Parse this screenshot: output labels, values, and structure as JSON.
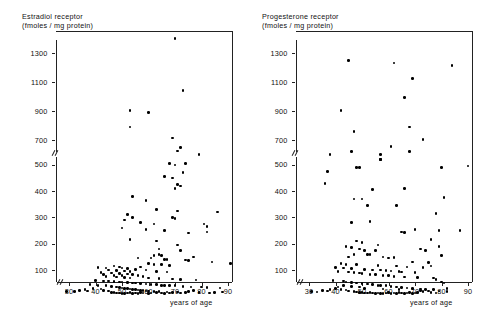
{
  "figure": {
    "width": 481,
    "height": 316,
    "background": "#ffffff",
    "point_color": "#000000",
    "axis_color": "#222222"
  },
  "panels": [
    {
      "id": "estradiol",
      "title_line1": "Estradiol receptor",
      "title_line2": "(fmoles / mg protein)"
    },
    {
      "id": "progesterone",
      "title_line1": "Progesterone receptor",
      "title_line2": "(fmoles / mg  protein)"
    }
  ],
  "axes": {
    "xlabel": "years of age",
    "xticks": [
      30,
      40,
      50,
      60,
      70,
      80,
      90
    ],
    "yticks_lower": [
      100,
      200,
      300,
      400,
      500
    ],
    "yticks_upper": [
      700,
      900,
      1100,
      1300
    ],
    "ylabel": "",
    "xlim": [
      24,
      94
    ],
    "ylim_lower": [
      0,
      560
    ],
    "ylim_upper": [
      640,
      1420
    ],
    "axis_break": true,
    "grid": false
  },
  "chart_data": [
    {
      "type": "scatter",
      "title": "Estradiol receptor (fmoles / mg protein)",
      "xlabel": "years of age",
      "ylabel": "Estradiol receptor (fmoles / mg protein)",
      "xlim": [
        24,
        94
      ],
      "ylim": [
        0,
        1420
      ],
      "grid": false,
      "legend": "none",
      "points": [
        [
          70,
          1400
        ],
        [
          73,
          1040
        ],
        [
          53,
          905
        ],
        [
          60,
          890
        ],
        [
          53,
          790
        ],
        [
          69,
          715
        ],
        [
          72,
          650
        ],
        [
          71,
          625
        ],
        [
          79,
          600
        ],
        [
          68,
          505
        ],
        [
          70,
          500
        ],
        [
          74,
          505
        ],
        [
          73,
          470
        ],
        [
          66,
          455
        ],
        [
          69,
          450
        ],
        [
          71,
          425
        ],
        [
          72,
          420
        ],
        [
          70,
          410
        ],
        [
          54,
          380
        ],
        [
          59,
          365
        ],
        [
          63,
          330
        ],
        [
          71,
          325
        ],
        [
          86,
          320
        ],
        [
          52,
          310
        ],
        [
          54,
          300
        ],
        [
          69,
          300
        ],
        [
          70,
          295
        ],
        [
          51,
          290
        ],
        [
          57,
          280
        ],
        [
          62,
          275
        ],
        [
          81,
          275
        ],
        [
          82,
          265
        ],
        [
          50,
          260
        ],
        [
          59,
          255
        ],
        [
          66,
          250
        ],
        [
          82,
          245
        ],
        [
          75,
          240
        ],
        [
          53,
          215
        ],
        [
          63,
          210
        ],
        [
          71,
          195
        ],
        [
          64,
          180
        ],
        [
          72,
          175
        ],
        [
          64,
          160
        ],
        [
          62,
          155
        ],
        [
          65,
          155
        ],
        [
          77,
          150
        ],
        [
          56,
          145
        ],
        [
          61,
          145
        ],
        [
          66,
          140
        ],
        [
          67,
          140
        ],
        [
          74,
          138
        ],
        [
          75,
          135
        ],
        [
          84,
          130
        ],
        [
          91,
          125
        ],
        [
          60,
          125
        ],
        [
          62,
          122
        ],
        [
          65,
          120
        ],
        [
          68,
          118
        ],
        [
          47,
          115
        ],
        [
          49,
          112
        ],
        [
          57,
          112
        ],
        [
          41,
          110
        ],
        [
          44,
          108
        ],
        [
          50,
          108
        ],
        [
          52,
          105
        ],
        [
          55,
          102
        ],
        [
          59,
          100
        ],
        [
          45,
          100
        ],
        [
          48,
          98
        ],
        [
          51,
          96
        ],
        [
          53,
          95
        ],
        [
          63,
          95
        ],
        [
          67,
          92
        ],
        [
          42,
          90
        ],
        [
          46,
          88
        ],
        [
          49,
          86
        ],
        [
          52,
          85
        ],
        [
          54,
          84
        ],
        [
          43,
          82
        ],
        [
          47,
          80
        ],
        [
          50,
          78
        ],
        [
          56,
          78
        ],
        [
          58,
          76
        ],
        [
          44,
          75
        ],
        [
          48,
          74
        ],
        [
          51,
          72
        ],
        [
          53,
          70
        ],
        [
          60,
          70
        ],
        [
          64,
          68
        ],
        [
          69,
          66
        ],
        [
          72,
          65
        ],
        [
          78,
          62
        ],
        [
          40,
          60
        ],
        [
          43,
          58
        ],
        [
          45,
          58
        ],
        [
          47,
          56
        ],
        [
          49,
          55
        ],
        [
          50,
          54
        ],
        [
          52,
          52
        ],
        [
          54,
          50
        ],
        [
          55,
          50
        ],
        [
          57,
          48
        ],
        [
          59,
          46
        ],
        [
          61,
          45
        ],
        [
          63,
          44
        ],
        [
          65,
          42
        ],
        [
          66,
          42
        ],
        [
          68,
          40
        ],
        [
          70,
          40
        ],
        [
          73,
          38
        ],
        [
          76,
          36
        ],
        [
          80,
          35
        ],
        [
          82,
          34
        ],
        [
          87,
          32
        ],
        [
          38,
          45
        ],
        [
          41,
          42
        ],
        [
          44,
          40
        ],
        [
          46,
          38
        ],
        [
          48,
          36
        ],
        [
          49,
          34
        ],
        [
          50,
          32
        ],
        [
          51,
          30
        ],
        [
          52,
          30
        ],
        [
          53,
          28
        ],
        [
          54,
          26
        ],
        [
          55,
          25
        ],
        [
          56,
          24
        ],
        [
          57,
          22
        ],
        [
          58,
          22
        ],
        [
          59,
          20
        ],
        [
          60,
          20
        ],
        [
          62,
          18
        ],
        [
          64,
          18
        ],
        [
          67,
          16
        ],
        [
          71,
          16
        ],
        [
          74,
          15
        ],
        [
          29,
          18
        ],
        [
          32,
          18
        ],
        [
          34,
          22
        ],
        [
          36,
          26
        ],
        [
          37,
          20
        ],
        [
          39,
          30
        ],
        [
          42,
          28
        ],
        [
          43,
          22
        ],
        [
          45,
          20
        ],
        [
          46,
          15
        ],
        [
          47,
          14
        ],
        [
          48,
          12
        ],
        [
          49,
          12
        ],
        [
          50,
          10
        ],
        [
          51,
          10
        ],
        [
          52,
          12
        ],
        [
          53,
          14
        ],
        [
          54,
          10
        ],
        [
          55,
          12
        ],
        [
          56,
          10
        ],
        [
          57,
          14
        ],
        [
          58,
          12
        ],
        [
          60,
          10
        ],
        [
          61,
          12
        ],
        [
          63,
          14
        ],
        [
          65,
          12
        ],
        [
          66,
          10
        ],
        [
          68,
          12
        ],
        [
          69,
          14
        ],
        [
          72,
          12
        ],
        [
          75,
          18
        ],
        [
          77,
          22
        ],
        [
          79,
          14
        ],
        [
          83,
          12
        ],
        [
          85,
          14
        ],
        [
          88,
          16
        ]
      ]
    },
    {
      "type": "scatter",
      "title": "Progesterone receptor (fmoles / mg protein)",
      "xlabel": "years of age",
      "ylabel": "Progesterone receptor (fmoles / mg protein)",
      "xlim": [
        24,
        94
      ],
      "ylim": [
        0,
        1420
      ],
      "grid": false,
      "legend": "none",
      "points": [
        [
          45,
          1250
        ],
        [
          62,
          1230
        ],
        [
          84,
          1215
        ],
        [
          69,
          1125
        ],
        [
          66,
          995
        ],
        [
          42,
          905
        ],
        [
          68,
          790
        ],
        [
          47,
          760
        ],
        [
          73,
          705
        ],
        [
          61,
          655
        ],
        [
          46,
          620
        ],
        [
          68,
          620
        ],
        [
          38,
          600
        ],
        [
          57,
          540
        ],
        [
          57,
          520
        ],
        [
          49,
          490
        ],
        [
          48,
          490
        ],
        [
          90,
          495
        ],
        [
          80,
          490
        ],
        [
          37,
          475
        ],
        [
          57,
          520
        ],
        [
          36,
          430
        ],
        [
          47,
          370
        ],
        [
          50,
          370
        ],
        [
          54,
          405
        ],
        [
          52,
          345
        ],
        [
          66,
          410
        ],
        [
          53,
          285
        ],
        [
          46,
          280
        ],
        [
          63,
          345
        ],
        [
          81,
          375
        ],
        [
          78,
          315
        ],
        [
          79,
          250
        ],
        [
          65,
          245
        ],
        [
          66,
          243
        ],
        [
          70,
          255
        ],
        [
          87,
          250
        ],
        [
          76,
          215
        ],
        [
          48,
          210
        ],
        [
          50,
          205
        ],
        [
          56,
          195
        ],
        [
          44,
          190
        ],
        [
          46,
          185
        ],
        [
          49,
          180
        ],
        [
          51,
          175
        ],
        [
          55,
          175
        ],
        [
          72,
          180
        ],
        [
          74,
          175
        ],
        [
          79,
          190
        ],
        [
          80,
          155
        ],
        [
          47,
          160
        ],
        [
          52,
          160
        ],
        [
          53,
          158
        ],
        [
          45,
          150
        ],
        [
          58,
          150
        ],
        [
          60,
          145
        ],
        [
          62,
          148
        ],
        [
          69,
          130
        ],
        [
          75,
          128
        ],
        [
          42,
          125
        ],
        [
          44,
          120
        ],
        [
          48,
          120
        ],
        [
          56,
          118
        ],
        [
          63,
          115
        ],
        [
          67,
          112
        ],
        [
          73,
          110
        ],
        [
          76,
          115
        ],
        [
          40,
          110
        ],
        [
          43,
          108
        ],
        [
          46,
          105
        ],
        [
          51,
          102
        ],
        [
          54,
          100
        ],
        [
          57,
          100
        ],
        [
          59,
          98
        ],
        [
          61,
          96
        ],
        [
          64,
          95
        ],
        [
          65,
          92
        ],
        [
          70,
          90
        ],
        [
          41,
          95
        ],
        [
          45,
          92
        ],
        [
          47,
          90
        ],
        [
          49,
          88
        ],
        [
          50,
          86
        ],
        [
          53,
          84
        ],
        [
          55,
          82
        ],
        [
          58,
          80
        ],
        [
          60,
          78
        ],
        [
          62,
          76
        ],
        [
          66,
          74
        ],
        [
          71,
          72
        ],
        [
          77,
          70
        ],
        [
          78,
          65
        ],
        [
          39,
          60
        ],
        [
          43,
          58
        ],
        [
          44,
          55
        ],
        [
          46,
          52
        ],
        [
          48,
          50
        ],
        [
          50,
          48
        ],
        [
          52,
          46
        ],
        [
          54,
          44
        ],
        [
          56,
          42
        ],
        [
          57,
          42
        ],
        [
          59,
          40
        ],
        [
          61,
          38
        ],
        [
          63,
          36
        ],
        [
          65,
          34
        ],
        [
          67,
          32
        ],
        [
          69,
          30
        ],
        [
          72,
          28
        ],
        [
          74,
          26
        ],
        [
          80,
          55
        ],
        [
          81,
          50
        ],
        [
          82,
          30
        ],
        [
          35,
          22
        ],
        [
          37,
          20
        ],
        [
          40,
          30
        ],
        [
          42,
          26
        ],
        [
          44,
          24
        ],
        [
          45,
          20
        ],
        [
          47,
          18
        ],
        [
          48,
          16
        ],
        [
          49,
          14
        ],
        [
          50,
          14
        ],
        [
          51,
          12
        ],
        [
          52,
          12
        ],
        [
          53,
          14
        ],
        [
          54,
          12
        ],
        [
          55,
          10
        ],
        [
          56,
          12
        ],
        [
          57,
          10
        ],
        [
          58,
          10
        ],
        [
          59,
          12
        ],
        [
          60,
          14
        ],
        [
          61,
          10
        ],
        [
          62,
          12
        ],
        [
          63,
          10
        ],
        [
          64,
          14
        ],
        [
          65,
          12
        ],
        [
          66,
          10
        ],
        [
          67,
          12
        ],
        [
          68,
          14
        ],
        [
          69,
          10
        ],
        [
          70,
          12
        ],
        [
          71,
          14
        ],
        [
          73,
          18
        ],
        [
          75,
          20
        ],
        [
          76,
          14
        ],
        [
          78,
          12
        ],
        [
          79,
          20
        ],
        [
          82,
          18
        ],
        [
          31,
          18
        ],
        [
          33,
          16
        ],
        [
          38,
          25
        ],
        [
          41,
          35
        ],
        [
          43,
          40
        ],
        [
          46,
          38
        ],
        [
          49,
          35
        ],
        [
          51,
          30
        ],
        [
          58,
          28
        ],
        [
          64,
          25
        ],
        [
          72,
          22
        ],
        [
          77,
          25
        ]
      ]
    }
  ]
}
